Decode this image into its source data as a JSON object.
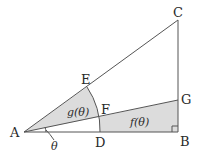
{
  "diagram": {
    "type": "geometry",
    "points": {
      "A": {
        "label": "A",
        "x": 24,
        "y": 132
      },
      "B": {
        "label": "B",
        "x": 178,
        "y": 132
      },
      "C": {
        "label": "C",
        "x": 178,
        "y": 20
      },
      "D": {
        "label": "D",
        "x": 100,
        "y": 132
      },
      "E": {
        "label": "E",
        "x": 87,
        "y": 87
      },
      "F": {
        "label": "F",
        "x": 99,
        "y": 117
      },
      "G": {
        "label": "G",
        "x": 178,
        "y": 100
      }
    },
    "regions": {
      "g": {
        "label": "g(θ)",
        "description": "sector AEF shaded"
      },
      "f": {
        "label": "f(θ)",
        "description": "region FDBG shaded"
      }
    },
    "angle": {
      "label": "θ",
      "description": "angle GAB at A"
    },
    "right_angle_at": "B",
    "colors": {
      "shade": "#dcdcdc",
      "line": "#555555"
    }
  }
}
